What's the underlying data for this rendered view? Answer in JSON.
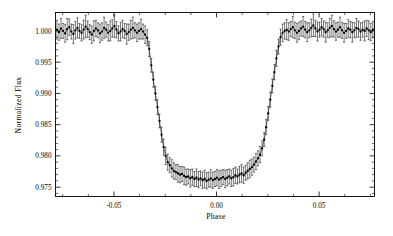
{
  "figure": {
    "background_color": "#ffffff",
    "ink_color": "#000000"
  },
  "chart_data": {
    "type": "scatter",
    "title": "",
    "subtitle": "",
    "xlabel": "Phase",
    "ylabel": "Normalized Flux",
    "xlim": [
      -0.0785,
      0.077
    ],
    "ylim": [
      0.9735,
      1.00295
    ],
    "grid": false,
    "legend_position": "none",
    "annotations": [],
    "marker": "filled-circle",
    "error_bars": "vertical",
    "connected_by_line": true,
    "xticks": [
      -0.05,
      0.0,
      0.05
    ],
    "xtick_labels": [
      "-0.05",
      "0.00",
      "0.05"
    ],
    "xticks_minor": [
      -0.075,
      -0.0625,
      -0.0375,
      -0.025,
      -0.0125,
      0.0125,
      0.025,
      0.0375,
      0.0625,
      0.075
    ],
    "yticks": [
      1.0,
      0.995,
      0.99,
      0.985,
      0.98,
      0.975
    ],
    "ytick_labels": [
      "1.000",
      "0.995",
      "0.990",
      "0.985",
      "0.980",
      "0.975"
    ],
    "yticks_minor": [
      0.999,
      0.998,
      0.997,
      0.996,
      0.994,
      0.993,
      0.992,
      0.991,
      0.989,
      0.988,
      0.987,
      0.986,
      0.984,
      0.983,
      0.982,
      0.981,
      0.979,
      0.978,
      0.977,
      0.976,
      0.974
    ],
    "series_name": "phase-folded transit photometry",
    "transit": {
      "depth": 0.0233,
      "out_of_transit_flux": 1.0001,
      "mid_transit_flux": 0.9766,
      "ingress_start_phase": -0.0345,
      "ingress_end_phase": -0.0235,
      "egress_start_phase": 0.0245,
      "egress_end_phase": 0.0352,
      "typical_error": 0.0013
    },
    "x": [
      -0.0778,
      -0.0768,
      -0.0758,
      -0.0748,
      -0.0738,
      -0.0728,
      -0.0718,
      -0.0708,
      -0.0698,
      -0.0688,
      -0.0678,
      -0.0668,
      -0.0658,
      -0.0648,
      -0.0638,
      -0.0628,
      -0.0618,
      -0.0608,
      -0.0598,
      -0.0588,
      -0.0578,
      -0.0568,
      -0.0558,
      -0.0548,
      -0.0538,
      -0.0528,
      -0.0518,
      -0.0508,
      -0.0498,
      -0.0488,
      -0.0478,
      -0.0468,
      -0.0458,
      -0.0448,
      -0.0438,
      -0.0428,
      -0.0418,
      -0.0408,
      -0.0398,
      -0.0388,
      -0.0378,
      -0.0368,
      -0.0358,
      -0.0348,
      -0.0338,
      -0.0328,
      -0.0318,
      -0.0308,
      -0.0298,
      -0.0288,
      -0.0278,
      -0.0268,
      -0.0258,
      -0.0248,
      -0.0238,
      -0.0228,
      -0.0218,
      -0.0208,
      -0.0198,
      -0.0188,
      -0.0178,
      -0.0168,
      -0.0158,
      -0.0148,
      -0.0138,
      -0.0128,
      -0.0118,
      -0.0108,
      -0.0098,
      -0.0088,
      -0.0078,
      -0.0068,
      -0.0058,
      -0.0048,
      -0.0038,
      -0.0028,
      -0.0018,
      -0.0008,
      0.0002,
      0.0012,
      0.0022,
      0.0032,
      0.0042,
      0.0052,
      0.0062,
      0.0072,
      0.0082,
      0.0092,
      0.0102,
      0.0112,
      0.0122,
      0.0132,
      0.0142,
      0.0152,
      0.0162,
      0.0172,
      0.0182,
      0.0192,
      0.0202,
      0.0212,
      0.0222,
      0.0232,
      0.0242,
      0.0252,
      0.0262,
      0.0272,
      0.0282,
      0.0292,
      0.0302,
      0.0312,
      0.0322,
      0.0332,
      0.0342,
      0.0352,
      0.0362,
      0.0372,
      0.0382,
      0.0392,
      0.0402,
      0.0412,
      0.0422,
      0.0432,
      0.0442,
      0.0452,
      0.0462,
      0.0472,
      0.0482,
      0.0492,
      0.0502,
      0.0512,
      0.0522,
      0.0532,
      0.0542,
      0.0552,
      0.0562,
      0.0572,
      0.0582,
      0.0592,
      0.0602,
      0.0612,
      0.0622,
      0.0632,
      0.0642,
      0.0652,
      0.0662,
      0.0672,
      0.0682,
      0.0692,
      0.0702,
      0.0712,
      0.0722,
      0.0732,
      0.0742,
      0.0752,
      0.0762
    ],
    "y": [
      1.0002,
      0.9998,
      1.0004,
      1.0,
      0.9996,
      1.0003,
      1.0006,
      0.9999,
      0.9995,
      1.0001,
      1.0005,
      1.0,
      0.9997,
      1.0002,
      1.0007,
      1.0003,
      0.9998,
      0.9994,
      1.0,
      1.0004,
      1.0001,
      0.9996,
      0.9999,
      1.0005,
      1.0002,
      0.9997,
      1.0,
      1.0004,
      1.0008,
      1.0002,
      0.9996,
      0.9999,
      1.0003,
      1.0,
      0.9995,
      0.9998,
      1.0002,
      1.0005,
      1.0001,
      0.9997,
      1.0,
      1.0003,
      0.9999,
      0.9994,
      0.9989,
      0.9971,
      0.9945,
      0.9922,
      0.99,
      0.9878,
      0.9856,
      0.9834,
      0.9814,
      0.98,
      0.979,
      0.9785,
      0.978,
      0.9776,
      0.9774,
      0.9772,
      0.977,
      0.9771,
      0.9768,
      0.9766,
      0.9767,
      0.9764,
      0.9766,
      0.9763,
      0.9765,
      0.9762,
      0.9764,
      0.9761,
      0.9763,
      0.976,
      0.9762,
      0.9764,
      0.9761,
      0.9763,
      0.9765,
      0.9762,
      0.9764,
      0.9766,
      0.9763,
      0.9765,
      0.9767,
      0.9764,
      0.9766,
      0.9769,
      0.9767,
      0.977,
      0.9772,
      0.9769,
      0.9773,
      0.9776,
      0.9779,
      0.9782,
      0.9786,
      0.9791,
      0.9796,
      0.9802,
      0.9812,
      0.9826,
      0.9846,
      0.9868,
      0.989,
      0.9912,
      0.9934,
      0.9956,
      0.9975,
      0.999,
      0.9997,
      1.0,
      1.0002,
      0.9999,
      1.0003,
      1.0006,
      1.0001,
      0.9997,
      1.0,
      1.0004,
      1.0007,
      1.0002,
      0.9998,
      1.0001,
      1.0005,
      1.0009,
      1.0004,
      0.9999,
      1.0002,
      1.0006,
      1.0003,
      0.9998,
      1.0001,
      1.0005,
      1.0008,
      1.0003,
      0.9999,
      1.0002,
      1.0006,
      1.0001,
      0.9997,
      1.0,
      1.0004,
      1.0002,
      0.9998,
      1.0001,
      1.0005,
      1.0003,
      0.9999,
      1.0002,
      1.0,
      1.0004,
      1.0001,
      0.9998,
      1.0002
    ],
    "yerr": [
      0.0015,
      0.0013,
      0.0016,
      0.0012,
      0.0014,
      0.0017,
      0.0013,
      0.0012,
      0.0015,
      0.0014,
      0.0016,
      0.0012,
      0.0013,
      0.0015,
      0.0018,
      0.0013,
      0.0012,
      0.0014,
      0.0016,
      0.0013,
      0.0012,
      0.0015,
      0.0014,
      0.0017,
      0.0012,
      0.0013,
      0.0016,
      0.0014,
      0.0018,
      0.0013,
      0.0012,
      0.0015,
      0.0014,
      0.0012,
      0.0016,
      0.0013,
      0.0015,
      0.0017,
      0.0012,
      0.0014,
      0.0013,
      0.0016,
      0.0012,
      0.0014,
      0.0013,
      0.0012,
      0.0011,
      0.0012,
      0.0011,
      0.0012,
      0.0011,
      0.0012,
      0.0013,
      0.0014,
      0.0013,
      0.0012,
      0.0014,
      0.0013,
      0.0012,
      0.0014,
      0.0013,
      0.0012,
      0.0014,
      0.0013,
      0.0012,
      0.0014,
      0.0013,
      0.0012,
      0.0014,
      0.0013,
      0.0012,
      0.0013,
      0.0014,
      0.0013,
      0.0012,
      0.0014,
      0.0013,
      0.0012,
      0.0013,
      0.0014,
      0.0013,
      0.0012,
      0.0014,
      0.0013,
      0.0012,
      0.0013,
      0.0014,
      0.0013,
      0.0012,
      0.0013,
      0.0014,
      0.0013,
      0.0012,
      0.0013,
      0.0014,
      0.0013,
      0.0012,
      0.0013,
      0.0012,
      0.0013,
      0.0012,
      0.0011,
      0.0012,
      0.0011,
      0.0012,
      0.0011,
      0.0012,
      0.0013,
      0.0012,
      0.0013,
      0.0014,
      0.0013,
      0.0016,
      0.0014,
      0.0012,
      0.0017,
      0.0013,
      0.0015,
      0.0014,
      0.0012,
      0.0016,
      0.0013,
      0.0015,
      0.0012,
      0.0014,
      0.0018,
      0.0013,
      0.0015,
      0.0012,
      0.0014,
      0.0013,
      0.0016,
      0.0012,
      0.0015,
      0.0017,
      0.0013,
      0.0014,
      0.0012,
      0.0016,
      0.0013,
      0.0015,
      0.0012,
      0.0014,
      0.0013,
      0.0016,
      0.0012,
      0.0015,
      0.0013,
      0.0014,
      0.0012,
      0.0016,
      0.0013,
      0.0015,
      0.0014,
      0.0013
    ]
  }
}
